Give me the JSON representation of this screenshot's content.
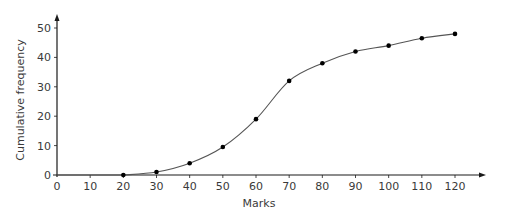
{
  "chart_data": {
    "type": "line",
    "title": "",
    "xlabel": "Marks",
    "ylabel": "Cumulative frequency",
    "x": [
      20,
      30,
      40,
      50,
      60,
      70,
      80,
      90,
      100,
      110,
      120
    ],
    "series": [
      {
        "name": "Cumulative frequency",
        "values": [
          0,
          1,
          4,
          9.5,
          19,
          32,
          38,
          42,
          44,
          46.5,
          48
        ]
      }
    ],
    "xlim": [
      0,
      120
    ],
    "ylim": [
      0,
      50
    ],
    "xticks": [
      0,
      10,
      20,
      30,
      40,
      50,
      60,
      70,
      80,
      90,
      100,
      110,
      120
    ],
    "yticks": [
      0,
      10,
      20,
      30,
      40,
      50
    ],
    "grid": false,
    "legend": "none",
    "smooth_curve": true
  },
  "colors": {
    "axis": "#1a1a1a",
    "curve": "#555555",
    "points": "#000000",
    "text": "#3a3a3a"
  }
}
